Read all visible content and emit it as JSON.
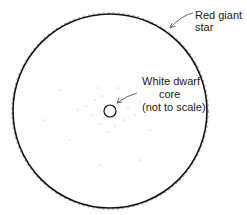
{
  "diagram": {
    "labels": {
      "red_giant_line1": "Red giant",
      "red_giant_line2": "star",
      "white_dwarf_line1": "White dwarf",
      "white_dwarf_line2": "core",
      "white_dwarf_line3": "(not to scale)"
    },
    "colors": {
      "stroke": "#111111",
      "text": "#1a1a1a",
      "dots": "#9a9a9a"
    }
  }
}
